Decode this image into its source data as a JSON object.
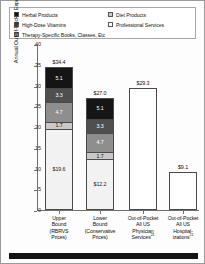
{
  "chart_data": {
    "type": "bar",
    "title": "",
    "xlabel": "",
    "ylabel": "Annual Out-of-Pocket Expenditures, $ in Billions",
    "ylim": [
      0,
      40
    ],
    "yticks": [
      0,
      5,
      10,
      15,
      20,
      25,
      30,
      35,
      40
    ],
    "ytick_labels": [
      "0",
      "5",
      "10",
      "15",
      "20",
      "25",
      "30",
      "35",
      "40"
    ],
    "grid": false,
    "legend_position": "top",
    "stacked": true,
    "categories": [
      "Upper Bound (RBRVS Prices)",
      "Lower Bound (Conservative Prices)",
      "Out-of-Pocket All US Physician Services",
      "Out-of-Pocket All US Hospitalizations"
    ],
    "series": [
      {
        "name": "Professional Services",
        "color": "#f2f2f2",
        "values": [
          19.6,
          12.2,
          29.3,
          9.1
        ]
      },
      {
        "name": "Diet Products",
        "color": "#c9c9c9",
        "values": [
          1.7,
          1.7,
          0,
          0
        ]
      },
      {
        "name": "Therapy-Specific Books, Classes, Etc",
        "color": "#8e8e8e",
        "values": [
          4.7,
          4.7,
          0,
          0
        ]
      },
      {
        "name": "High-Dose Vitamins",
        "color": "#4f4f4f",
        "values": [
          3.3,
          3.3,
          0,
          0
        ]
      },
      {
        "name": "Herbal Products",
        "color": "#151515",
        "values": [
          5.1,
          5.1,
          0,
          0
        ]
      }
    ],
    "totals": [
      34.4,
      27.0,
      29.3,
      9.1
    ],
    "total_labels": [
      "$34.4",
      "$27.0",
      "$29.3",
      "$9.1"
    ]
  },
  "legend": {
    "items": [
      {
        "label": "Herbal Products",
        "swatch": "#151515",
        "column": "left"
      },
      {
        "label": "High-Dose Vitamins",
        "swatch": "#4f4f4f",
        "column": "left"
      },
      {
        "label": "Therapy-Specific Books, Classes, Etc",
        "swatch": "#8e8e8e",
        "column": "left"
      },
      {
        "label": "Diet Products",
        "swatch": "#c9c9c9",
        "column": "right"
      },
      {
        "label": "Professional Services",
        "swatch": "#ffffff",
        "column": "right"
      }
    ]
  },
  "bars": [
    {
      "total_label": "$34.4",
      "segments": [
        {
          "label": "5.1",
          "value": 5.1,
          "color": "#151515",
          "text_color": "#ffffff"
        },
        {
          "label": "3.3",
          "value": 3.3,
          "color": "#4f4f4f",
          "text_color": "#ffffff"
        },
        {
          "label": "4.7",
          "value": 4.7,
          "color": "#8e8e8e",
          "text_color": "#ffffff"
        },
        {
          "label": "1.7",
          "value": 1.7,
          "color": "#c9c9c9",
          "text_color": "#1a1a1a"
        },
        {
          "label": "$19.6",
          "value": 19.6,
          "color": "#f2f2f2",
          "text_color": "#1a1a1a"
        }
      ]
    },
    {
      "total_label": "$27.0",
      "segments": [
        {
          "label": "5.1",
          "value": 5.1,
          "color": "#151515",
          "text_color": "#ffffff"
        },
        {
          "label": "3.3",
          "value": 3.3,
          "color": "#4f4f4f",
          "text_color": "#ffffff"
        },
        {
          "label": "4.7",
          "value": 4.7,
          "color": "#8e8e8e",
          "text_color": "#ffffff"
        },
        {
          "label": "1.7",
          "value": 1.7,
          "color": "#c9c9c9",
          "text_color": "#1a1a1a"
        },
        {
          "label": "$12.2",
          "value": 12.2,
          "color": "#f2f2f2",
          "text_color": "#1a1a1a"
        }
      ]
    },
    {
      "total_label": "$29.3",
      "segments": [
        {
          "label": "",
          "value": 29.3,
          "color": "#ffffff",
          "text_color": "#1a1a1a"
        }
      ]
    },
    {
      "total_label": "$9.1",
      "segments": [
        {
          "label": "",
          "value": 9.1,
          "color": "#ffffff",
          "text_color": "#1a1a1a"
        }
      ]
    }
  ],
  "axis": {
    "y_title": "Annual Out-of-Pocket Expenditures, $ in Billions",
    "y_ticks": [
      "40",
      "35",
      "30",
      "25",
      "20",
      "15",
      "10",
      "5",
      "0"
    ]
  },
  "x_labels": [
    {
      "lines": [
        "Upper",
        "Bound",
        "(RBRVS",
        "Prices)"
      ],
      "sup": ""
    },
    {
      "lines": [
        "Lower",
        "Bound",
        "(Conservative",
        "Prices)"
      ],
      "sup": ""
    },
    {
      "lines": [
        "Out-of-Pocket",
        "All US",
        "Physician",
        "Services"
      ],
      "sup": "21"
    },
    {
      "lines": [
        "Out-of-Pocket",
        "All US",
        "Hospital-",
        "izations"
      ],
      "sup": "21"
    }
  ]
}
